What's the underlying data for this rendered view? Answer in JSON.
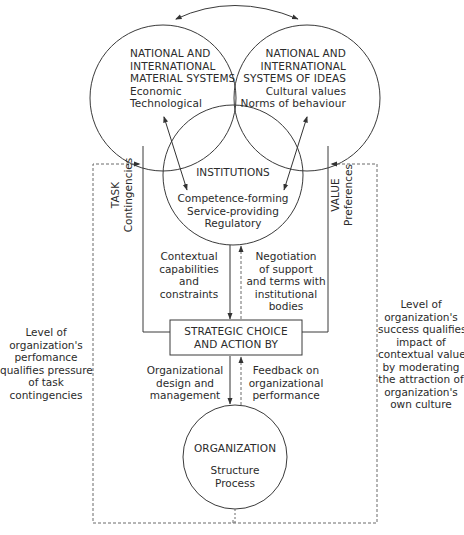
{
  "diagram": {
    "material_systems": {
      "title": [
        "NATIONAL AND",
        "INTERNATIONAL",
        "MATERIAL SYSTEMS"
      ],
      "items": [
        "Economic",
        "Technological"
      ]
    },
    "ideas_systems": {
      "title": [
        "NATIONAL AND",
        "INTERNATIONAL",
        "SYSTEMS OF IDEAS"
      ],
      "items": [
        "Cultural values",
        "Norms of behaviour"
      ]
    },
    "institutions": {
      "title": "INSTITUTIONS",
      "items": [
        "Competence-forming",
        "Service-providing",
        "Regulatory"
      ]
    },
    "task_label": {
      "title": "TASK",
      "sub": "Contingencies"
    },
    "value_label": {
      "title": "VALUE",
      "sub": "Preferences"
    },
    "contextual": [
      "Contextual",
      "capabilities",
      "and",
      "constraints"
    ],
    "negotiation": [
      "Negotiation",
      "of support",
      "and terms with",
      "institutional",
      "bodies"
    ],
    "strategic_box": [
      "STRATEGIC CHOICE",
      "AND ACTION BY"
    ],
    "org_design": [
      "Organizational",
      "design and",
      "management"
    ],
    "feedback": [
      "Feedback on",
      "organizational",
      "performance"
    ],
    "organization": {
      "title": "ORGANIZATION",
      "items": [
        "Structure",
        "Process"
      ]
    },
    "left_note": [
      "Level of",
      "organization's",
      "perfomance",
      "qualifies pressure",
      "of task",
      "contingencies"
    ],
    "right_note": [
      "Level of",
      "organization's",
      "success qualifies",
      "impact of",
      "contextual values",
      "by moderating",
      "the attraction of",
      "organization's",
      "own culture"
    ]
  },
  "colors": {
    "stroke": "#3a3a3a",
    "dashed": "#6a6a6a",
    "text": "#2b2b2b"
  }
}
